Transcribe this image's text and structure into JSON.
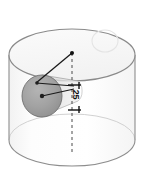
{
  "figure": {
    "type": "technical-geometry-illustration",
    "dimensions": {
      "width": 145,
      "height": 181
    },
    "background_color": "#ffffff"
  },
  "annotations": {
    "dimension_25": {
      "value": "25",
      "orientation": "vertical-rotated",
      "x": 71,
      "y": 90
    }
  },
  "shapes": {
    "cylinder": {
      "name": "transparent-cylinder",
      "center_x": 72,
      "top_center_y": 55,
      "bottom_center_y": 140,
      "radius_x": 63,
      "radius_y": 26,
      "body_fill": "#fcfcfc",
      "top_fill": "#f7f7f7",
      "outline_color": "#8a8a8a",
      "hidden_outline_color": "#c2c2c2"
    },
    "disk": {
      "name": "shaded-circular-hole",
      "center_x": 42,
      "center_y": 96,
      "radius_x": 20,
      "radius_y": 21,
      "fill": "#a0a0a0",
      "outline_color": "#6e6e6e"
    },
    "ghost_circle": {
      "name": "faint-construction-circle",
      "center_x": 105,
      "center_y": 41,
      "radius_x": 13,
      "radius_y": 11,
      "outline_color": "#e2e2e2"
    },
    "axis_line": {
      "name": "dashed-vertical-axis",
      "x": 72,
      "y_top": 53,
      "y_bottom": 152,
      "color": "#4a4a4a",
      "dash": "3 3"
    },
    "radius_line": {
      "name": "radius-leader-line",
      "x1": 72,
      "y1": 53,
      "x2": 36,
      "y2": 83,
      "color": "#1a1a1a"
    },
    "chord_line": {
      "name": "chord-leader-line",
      "x1": 36,
      "y1": 83,
      "x2": 72,
      "y2": 86,
      "color": "#1a1a1a"
    },
    "center_line": {
      "name": "disk-center-leader-line",
      "x1": 42,
      "y1": 96,
      "x2": 72,
      "y2": 89,
      "color": "#1a1a1a"
    },
    "apex_point": {
      "name": "cylinder-top-center-point",
      "x": 72,
      "y": 53
    },
    "disk_center_point": {
      "name": "disk-center-point",
      "x": 42,
      "y": 96
    },
    "dimension_ticks": {
      "name": "dimension-tick-marks",
      "top_y": 85,
      "bottom_y": 110,
      "x_left": 68,
      "x_right": 81,
      "color": "#111111"
    }
  }
}
